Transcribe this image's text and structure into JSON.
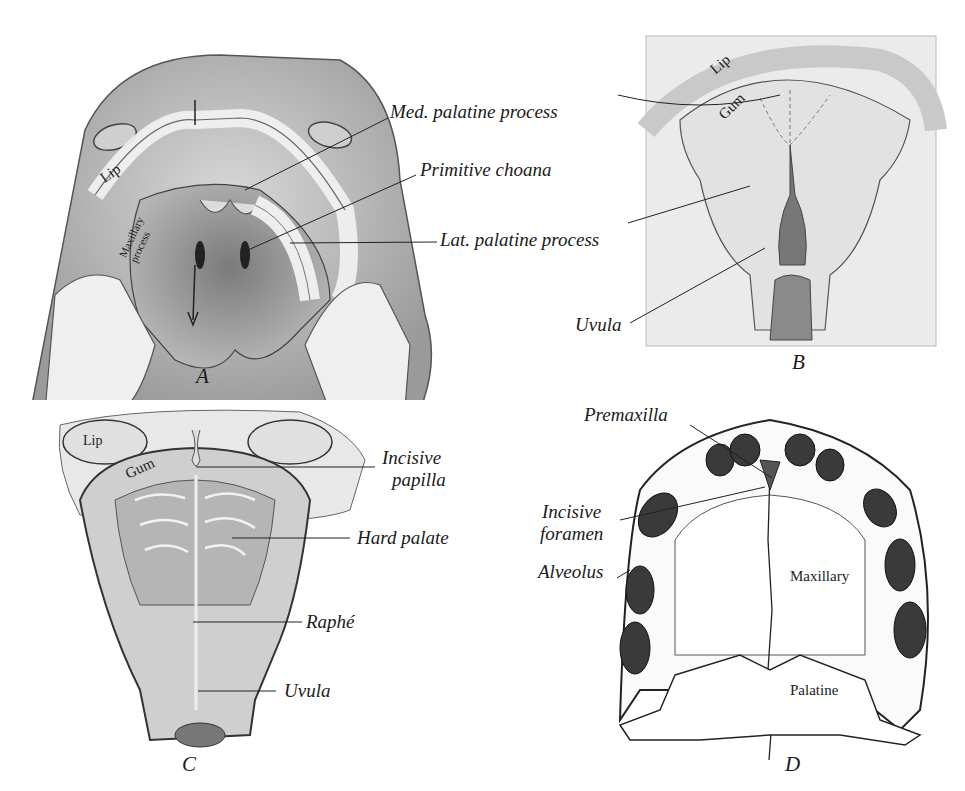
{
  "figure": {
    "panels": [
      {
        "id": "A",
        "letter": "A",
        "labels": {
          "med_palatine_process": "Med. palatine process",
          "primitive_choana": "Primitive choana",
          "lat_palatine_process": "Lat. palatine process",
          "lip": "Lip",
          "maxillary_process": "Maxillary process"
        }
      },
      {
        "id": "B",
        "letter": "B",
        "labels": {
          "lip": "Lip",
          "gum": "Gum",
          "uvula": "Uvula"
        }
      },
      {
        "id": "C",
        "letter": "C",
        "labels": {
          "lip": "Lip",
          "gum": "Gum",
          "incisive_papilla_1": "Incisive",
          "incisive_papilla_2": "papilla",
          "hard_palate": "Hard palate",
          "raphe": "Raphé",
          "uvula": "Uvula"
        }
      },
      {
        "id": "D",
        "letter": "D",
        "labels": {
          "premaxilla": "Premaxilla",
          "incisive_foramen_1": "Incisive",
          "incisive_foramen_2": "foramen",
          "alveolus": "Alveolus",
          "maxillary": "Maxillary",
          "palatine": "Palatine"
        }
      }
    ],
    "colors": {
      "ink": "#1a1a1a",
      "tissue_light": "#e6e6e6",
      "tissue_mid": "#bdbdbd",
      "tissue_dark": "#6e6e6e",
      "cut_surface": "#efefef"
    }
  }
}
